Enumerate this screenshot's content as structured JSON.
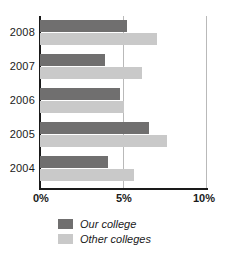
{
  "chart_data": {
    "type": "bar",
    "orientation": "horizontal",
    "title": "",
    "xlabel": "",
    "ylabel": "",
    "categories": [
      "2008",
      "2007",
      "2006",
      "2005",
      "2004"
    ],
    "series": [
      {
        "name": "Our college",
        "color": "#706f6f",
        "values": [
          5.2,
          3.9,
          4.8,
          6.5,
          4.1
        ]
      },
      {
        "name": "Other colleges",
        "color": "#c9c9c9",
        "values": [
          7.0,
          6.1,
          5.0,
          7.6,
          5.6
        ]
      }
    ],
    "xlim": [
      0,
      10
    ],
    "xticks": [
      "0%",
      "5%",
      "10%"
    ],
    "xtick_values": [
      0,
      5,
      10
    ],
    "grid": true,
    "legend_position": "bottom-left"
  },
  "axis": {
    "tick_0": "0%",
    "tick_5": "5%",
    "tick_10": "10%"
  },
  "years": {
    "y2008": "2008",
    "y2007": "2007",
    "y2006": "2006",
    "y2005": "2005",
    "y2004": "2004"
  },
  "legend": {
    "ours": "Our college",
    "others": "Other colleges"
  }
}
